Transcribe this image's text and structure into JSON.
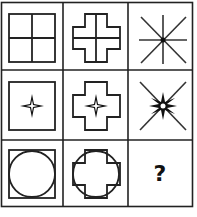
{
  "puzzle": {
    "type": "3x3 figure matrix",
    "rows": 3,
    "cols": 3,
    "line_color": "#222222",
    "cells": [
      {
        "row": 1,
        "col": 1,
        "description": "square divided into four quadrants by a cross"
      },
      {
        "row": 1,
        "col": 2,
        "description": "plus-shaped cross outline divided by inner cross lines"
      },
      {
        "row": 1,
        "col": 3,
        "description": "eight-ray asterisk with center dot"
      },
      {
        "row": 2,
        "col": 1,
        "description": "square outline with four-pointed star inside"
      },
      {
        "row": 2,
        "col": 2,
        "description": "plus-shaped cross outline with four-pointed star inside"
      },
      {
        "row": 2,
        "col": 3,
        "description": "X lines with eight-pointed star in center"
      },
      {
        "row": 3,
        "col": 1,
        "description": "square outline with inscribed circle"
      },
      {
        "row": 3,
        "col": 2,
        "description": "plus-shaped cross outline overlapping circle"
      },
      {
        "row": 3,
        "col": 3,
        "description": "missing figure",
        "label": "?"
      }
    ]
  }
}
